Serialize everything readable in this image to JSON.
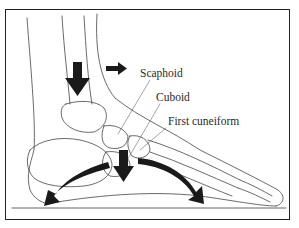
{
  "figure": {
    "labels": {
      "scaphoid": "Scaphoid",
      "cuboid": "Cuboid",
      "first_cuneiform": "First cuneiform"
    },
    "arrows": [
      {
        "name": "load-arrow-tibia",
        "direction": "down"
      },
      {
        "name": "direction-arrow",
        "direction": "right"
      },
      {
        "name": "load-arrow-midfoot",
        "direction": "down"
      },
      {
        "name": "arch-arrow-heel",
        "direction": "down-left"
      },
      {
        "name": "arch-arrow-forefoot",
        "direction": "down-right"
      }
    ],
    "colors": {
      "line": "#333333",
      "arrow": "#1a1a1a",
      "background": "#ffffff"
    }
  }
}
